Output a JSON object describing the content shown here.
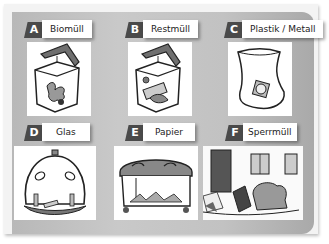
{
  "categories": [
    {
      "letter": "A",
      "label": "Biomüll",
      "icon": "organic-waste-bin-icon"
    },
    {
      "letter": "B",
      "label": "Restmüll",
      "icon": "residual-waste-bin-icon"
    },
    {
      "letter": "C",
      "label": "Plastik / Metall",
      "icon": "plastic-metal-bag-icon"
    },
    {
      "letter": "D",
      "label": "Glas",
      "icon": "glass-container-icon"
    },
    {
      "letter": "E",
      "label": "Papier",
      "icon": "paper-container-icon"
    },
    {
      "letter": "F",
      "label": "Sperrmüll",
      "icon": "bulky-waste-icon"
    }
  ],
  "colors": {
    "tab": "#4a4a4a",
    "panel": "#c2c2c2",
    "label_bg": "#ffffff"
  }
}
